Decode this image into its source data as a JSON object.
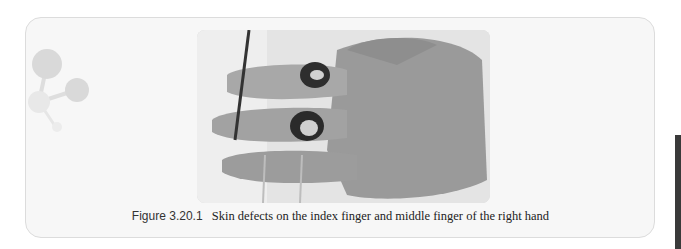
{
  "figure": {
    "label": "Figure 3.20.1",
    "caption": "Skin defects on the index finger and middle finger of the right hand",
    "image_description": "Clinical photograph of a right hand palm-up with circular skin defects on the index and middle fingers, surgical scissors and probes visible"
  },
  "decoration": {
    "icon": "molecule-icon"
  },
  "colors": {
    "card_background": "#f7f7f7",
    "card_border": "#dcdcdc",
    "side_bar": "#3a3a3a"
  }
}
